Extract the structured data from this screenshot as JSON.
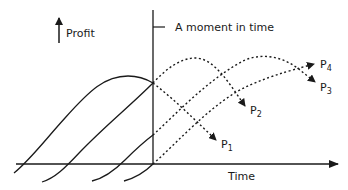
{
  "diagram": {
    "y_axis_label": "Profit",
    "x_axis_label": "Time",
    "marker_label": "A moment in time",
    "products": [
      {
        "name": "P",
        "sub": "1"
      },
      {
        "name": "P",
        "sub": "2"
      },
      {
        "name": "P",
        "sub": "3"
      },
      {
        "name": "P",
        "sub": "4"
      }
    ],
    "colors": {
      "line": "#1a1a1a",
      "background": "#ffffff"
    }
  }
}
